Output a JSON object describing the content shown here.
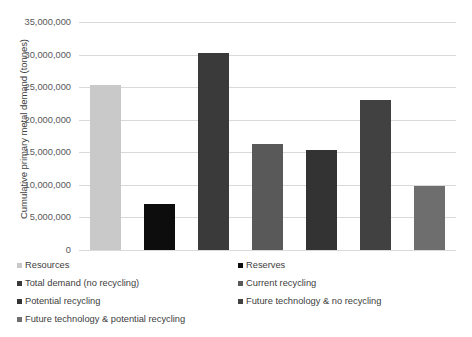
{
  "chart_data": {
    "type": "bar",
    "title": "",
    "xlabel": "",
    "ylabel": "Cumulative primary metal demand (tonnes)",
    "ylim": [
      0,
      35000000
    ],
    "grid": true,
    "legend_position": "bottom",
    "categories": [
      ""
    ],
    "y_ticks": [
      "35,000,000",
      "30,000,000",
      "25,000,000",
      "20,000,000",
      "15,000,000",
      "10,000,000",
      "5,000,000",
      "0"
    ],
    "y_tick_values": [
      35000000,
      30000000,
      25000000,
      20000000,
      15000000,
      10000000,
      5000000,
      0
    ],
    "series": [
      {
        "name": "Resources",
        "value": 25300000,
        "color": "#c9c9c9"
      },
      {
        "name": "Reserves",
        "value": 7000000,
        "color": "#0d0d0d"
      },
      {
        "name": "Total demand (no recycling)",
        "value": 30300000,
        "color": "#3a3a3a"
      },
      {
        "name": "Current recycling",
        "value": 16200000,
        "color": "#595959"
      },
      {
        "name": "Potential recycling",
        "value": 15400000,
        "color": "#333333"
      },
      {
        "name": "Future technology & no recycling",
        "value": 23000000,
        "color": "#414141"
      },
      {
        "name": "Future technology & potential recycling",
        "value": 9800000,
        "color": "#6e6e6e"
      }
    ]
  },
  "legend": {
    "column_left": [
      {
        "label": "Resources",
        "color": "#c9c9c9"
      },
      {
        "label": "Total demand (no recycling)",
        "color": "#3a3a3a"
      },
      {
        "label": "Potential recycling",
        "color": "#333333"
      },
      {
        "label": "Future technology & potential recycling",
        "color": "#6e6e6e"
      }
    ],
    "column_right": [
      {
        "label": "Reserves",
        "color": "#0d0d0d"
      },
      {
        "label": "Current recycling",
        "color": "#595959"
      },
      {
        "label": "Future technology & no recycling",
        "color": "#414141"
      }
    ]
  }
}
